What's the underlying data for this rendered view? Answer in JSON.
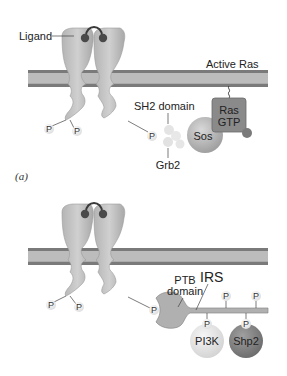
{
  "figure": {
    "header_text": "",
    "colors": {
      "membrane_dark": "#7a7a7a",
      "membrane_light": "#bcbcbc",
      "receptor": "#c4c4c4",
      "receptor_shadow": "#9a9a9a",
      "ligand_ball": "#4a4a4a",
      "ras_box": "#8a8a8a",
      "sos": "#b8b8b8",
      "grb2": "#e6e6e6",
      "irs": "#b0b0b0",
      "pi3k": "#e4e4e4",
      "shp2": "#7f7f7f",
      "phospho": "#efefef"
    }
  },
  "panel_a": {
    "label": "(a)",
    "ligand_label": "Ligand",
    "active_ras_label": "Active Ras",
    "ras_label_line1": "Ras",
    "ras_label_line2": "GTP",
    "sos_label": "Sos",
    "sh2_label": "SH2 domain",
    "grb2_label": "Grb2",
    "phospho_labels": [
      "P",
      "P",
      "P"
    ]
  },
  "panel_b": {
    "ptb_label_line1": "PTB",
    "ptb_label_line2": "domain",
    "irs_label": "IRS",
    "pi3k_label": "PI3K",
    "shp2_label": "Shp2",
    "phospho_labels": [
      "P",
      "P",
      "P",
      "P",
      "P",
      "P",
      "P"
    ]
  }
}
